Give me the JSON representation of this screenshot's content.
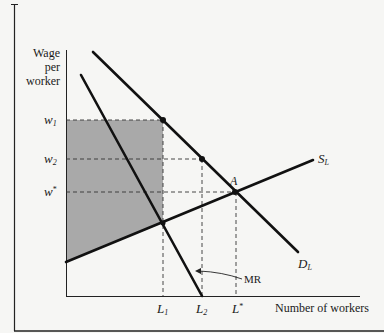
{
  "diagram": {
    "y_axis_label": [
      "Wage",
      "per",
      "worker"
    ],
    "x_axis_label": "Number of workers",
    "y_ticks": [
      {
        "sym": "w",
        "sub": "1",
        "sup": "",
        "y": 120
      },
      {
        "sym": "w",
        "sub": "2",
        "sup": "",
        "y": 159
      },
      {
        "sym": "w",
        "sub": "",
        "sup": "*",
        "y": 192
      }
    ],
    "x_ticks": [
      {
        "sym": "L",
        "sub": "1",
        "sup": "",
        "x": 163
      },
      {
        "sym": "L",
        "sub": "2",
        "sup": "",
        "x": 202
      },
      {
        "sym": "L",
        "sub": "",
        "sup": "*",
        "x": 236
      }
    ],
    "curves": {
      "supply": {
        "label": "S",
        "sub": "L"
      },
      "demand": {
        "label": "D",
        "sub": "L"
      },
      "marginal_revenue": {
        "label": "MR"
      }
    },
    "point_label": "A",
    "colors": {
      "background": "#f6f6f4",
      "line": "#111111",
      "shade": "#a9a9a9",
      "dash": "#333333"
    }
  }
}
